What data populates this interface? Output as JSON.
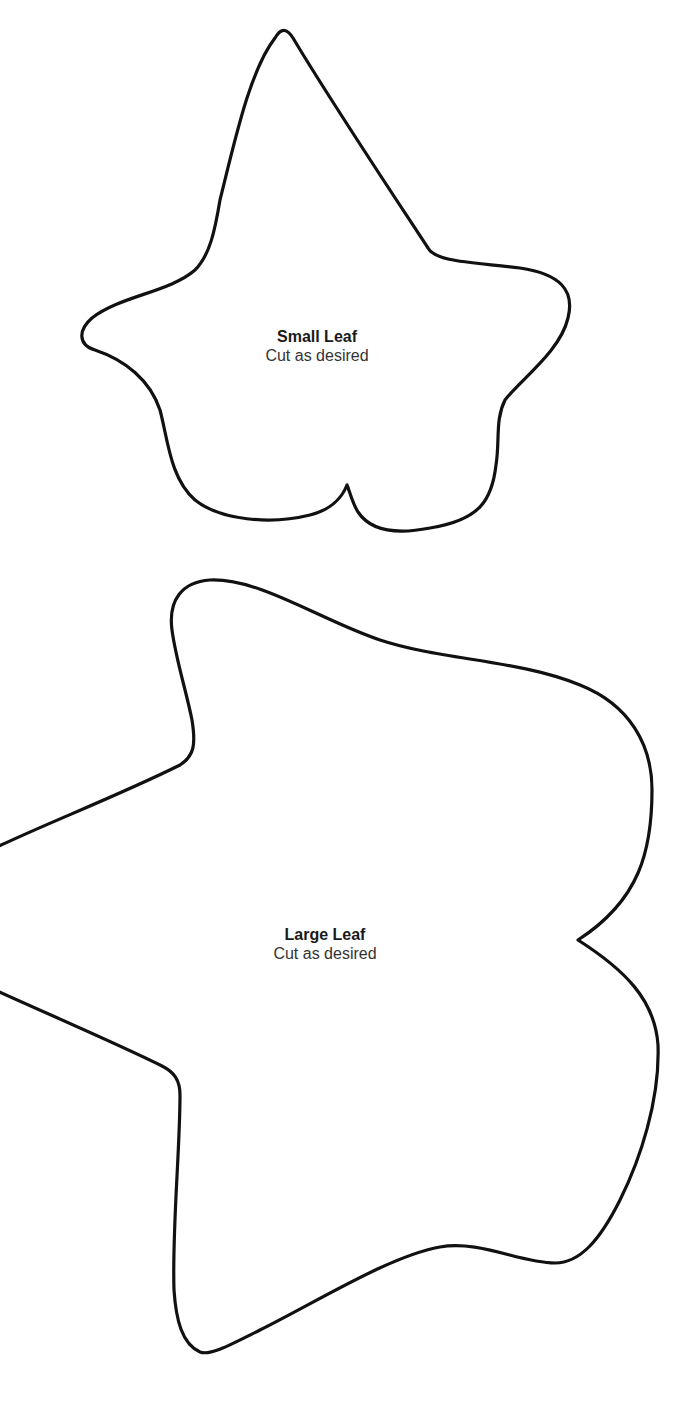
{
  "document": {
    "type": "cut-out template",
    "background_color": "#ffffff",
    "outline_color": "#111111"
  },
  "shapes": [
    {
      "id": "small",
      "shape": "ivy leaf outline (5-lobed, pointed tip at top)",
      "title": "Small Leaf",
      "instruction": "Cut as desired"
    },
    {
      "id": "large",
      "shape": "ivy leaf outline (rounded lobes, notch on right edge)",
      "title": "Large Leaf",
      "instruction": "Cut as desired"
    }
  ]
}
